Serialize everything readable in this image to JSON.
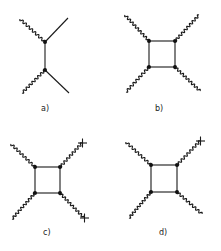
{
  "figure": {
    "panels": [
      {
        "id": "a",
        "label": "a)",
        "label_pos": [
          45,
          110
        ]
      },
      {
        "id": "b",
        "label": "b)",
        "label_pos": [
          159,
          110
        ]
      },
      {
        "id": "c",
        "label": "c)",
        "label_pos": [
          47,
          234
        ]
      },
      {
        "id": "d",
        "label": "d)",
        "label_pos": [
          163,
          234
        ]
      }
    ],
    "colors": {
      "ink": "#1a1a1a",
      "background": "#ffffff"
    }
  }
}
